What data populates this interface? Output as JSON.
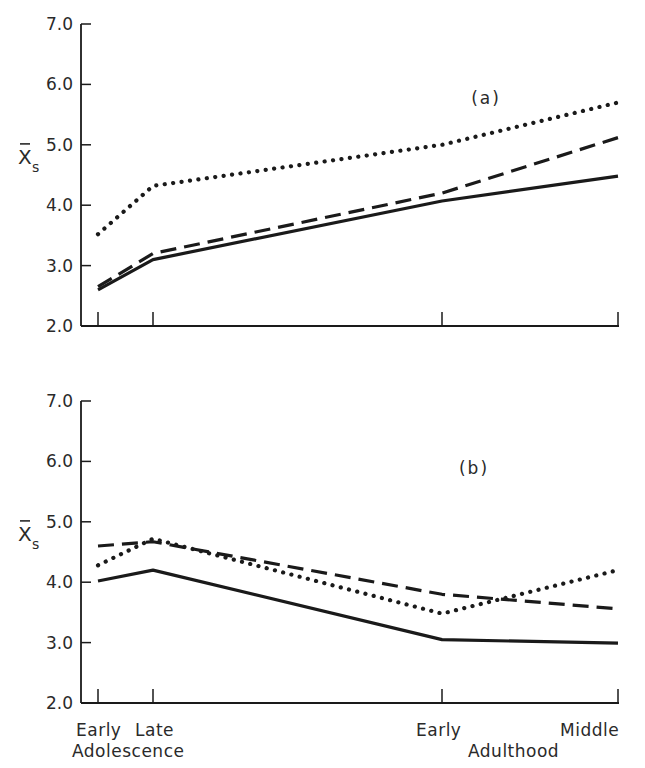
{
  "chart_data": [
    {
      "type": "line",
      "panel_label": "(a)",
      "ylabel": "X̄s",
      "ylim": [
        2.0,
        7.0
      ],
      "yticks": [
        "2.0",
        "3.0",
        "4.0",
        "5.0",
        "6.0",
        "7.0"
      ],
      "categories": [
        "Early Adolescence",
        "Late Adolescence",
        "Early Adulthood",
        "Middle Adulthood"
      ],
      "series": [
        {
          "name": "solid",
          "style": "solid",
          "values": [
            2.6,
            3.1,
            4.07,
            4.48
          ]
        },
        {
          "name": "dashed",
          "style": "dashed",
          "values": [
            2.65,
            3.2,
            4.2,
            5.12
          ]
        },
        {
          "name": "dotted",
          "style": "dotted",
          "values": [
            3.52,
            4.32,
            5.0,
            5.7
          ]
        }
      ],
      "grid": false,
      "legend": "none"
    },
    {
      "type": "line",
      "panel_label": "(b)",
      "ylabel": "X̄s",
      "ylim": [
        2.0,
        7.0
      ],
      "yticks": [
        "2.0",
        "3.0",
        "4.0",
        "5.0",
        "6.0",
        "7.0"
      ],
      "categories": [
        "Early Adolescence",
        "Late Adolescence",
        "Early Adulthood",
        "Middle Adulthood"
      ],
      "series": [
        {
          "name": "solid",
          "style": "solid",
          "values": [
            4.02,
            4.2,
            3.05,
            2.99
          ]
        },
        {
          "name": "dashed",
          "style": "dashed",
          "values": [
            4.6,
            4.67,
            3.8,
            3.56
          ]
        },
        {
          "name": "dotted",
          "style": "dotted",
          "values": [
            4.28,
            4.72,
            3.48,
            4.2
          ]
        }
      ],
      "grid": false,
      "legend": "none"
    }
  ],
  "xaxis": {
    "top_labels": [
      "Early",
      "Late",
      "Early",
      "Middle"
    ],
    "group_labels": [
      "Adolescence",
      "Adulthood"
    ]
  },
  "yaxis_label": {
    "main": "X",
    "sub": "s"
  },
  "colors": {
    "ink": "#1a1a1a",
    "text": "#2a2a2a",
    "background": "#ffffff"
  }
}
